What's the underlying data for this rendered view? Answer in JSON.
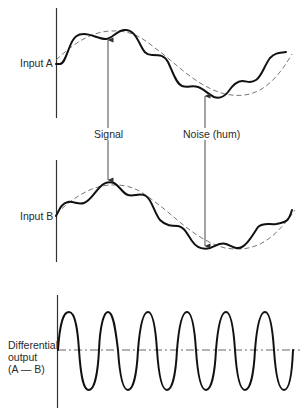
{
  "figure": {
    "panels": [
      {
        "id": "input_a",
        "label": "Input A"
      },
      {
        "id": "input_b",
        "label": "Input B"
      },
      {
        "id": "differential",
        "label_lines": [
          "Differential",
          "output",
          "(A — B)"
        ]
      }
    ],
    "annotations": {
      "signal": "Signal",
      "noise": "Noise (hum)"
    },
    "colors": {
      "curve": "#111111",
      "dashed": "#666666",
      "axis": "#333333",
      "arrow": "#333333"
    }
  },
  "labels": {
    "input_a": "Input A",
    "input_b": "Input B",
    "diff_line1": "Differential",
    "diff_line2": "output",
    "diff_line3": "(A — B)",
    "signal": "Signal",
    "noise": "Noise (hum)"
  }
}
